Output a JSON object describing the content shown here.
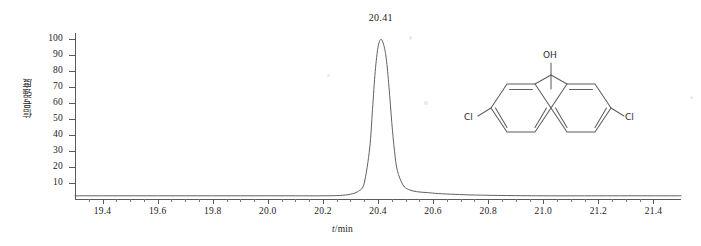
{
  "chart_data": {
    "type": "line",
    "title": "",
    "subtitle": "",
    "xlabel": "t/min",
    "xlabel_italic_part": "t",
    "xlabel_rest": "/min",
    "ylabel": "信号强度",
    "xlim": [
      19.3,
      21.5
    ],
    "ylim": [
      0,
      104
    ],
    "grid": false,
    "legend": null,
    "x_ticks": [
      "19.4",
      "19.6",
      "19.8",
      "20.0",
      "20.2",
      "20.4",
      "20.6",
      "20.8",
      "21.0",
      "21.2",
      "21.4"
    ],
    "x_tick_values": [
      19.4,
      19.6,
      19.8,
      20.0,
      20.2,
      20.4,
      20.6,
      20.8,
      21.0,
      21.2,
      21.4
    ],
    "y_ticks": [
      "100",
      "90",
      "80",
      "70",
      "60",
      "50",
      "40",
      "30",
      "20",
      "10"
    ],
    "y_tick_values": [
      100,
      90,
      80,
      70,
      60,
      50,
      40,
      30,
      20,
      10
    ],
    "annotations": [
      {
        "label": "20.41",
        "x": 20.41,
        "y": 100,
        "kind": "peak-retention-time"
      }
    ],
    "series": [
      {
        "name": "chromatogram",
        "color": "#4f4f4f",
        "x": [
          19.3,
          19.4,
          19.5,
          19.6,
          19.7,
          19.8,
          19.9,
          20.0,
          20.1,
          20.2,
          20.26,
          20.3,
          20.33,
          20.35,
          20.37,
          20.38,
          20.39,
          20.4,
          20.41,
          20.42,
          20.43,
          20.44,
          20.45,
          20.46,
          20.47,
          20.49,
          20.51,
          20.54,
          20.58,
          20.62,
          20.68,
          20.75,
          20.85,
          21.0,
          21.2,
          21.4,
          21.5
        ],
        "y": [
          2.0,
          2.0,
          2.0,
          2.0,
          2.0,
          2.0,
          2.0,
          2.0,
          2.0,
          2.0,
          2.2,
          3.0,
          5.0,
          10.0,
          32.0,
          56.0,
          80.0,
          95.0,
          100.0,
          97.0,
          88.0,
          70.0,
          48.0,
          30.0,
          18.0,
          9.0,
          6.0,
          4.6,
          4.0,
          3.4,
          2.9,
          2.5,
          2.2,
          2.0,
          2.0,
          2.0,
          2.0
        ]
      }
    ]
  },
  "molecule": {
    "name": "1,1-bis(4-chlorophenyl)ethanol",
    "atom_labels": [
      {
        "text": "OH",
        "role": "hydroxyl-label"
      },
      {
        "text": "Cl",
        "role": "chlorine-left-label"
      },
      {
        "text": "Cl",
        "role": "chlorine-right-label"
      }
    ],
    "hydroxyl": "OH",
    "chlorine_left": "Cl",
    "chlorine_right": "Cl"
  },
  "colors": {
    "background": "#ffffff",
    "axis": "#5a5a5a",
    "trace": "#4f4f4f",
    "text": "#1a1a1a",
    "molecule": "#2b2b2b"
  }
}
